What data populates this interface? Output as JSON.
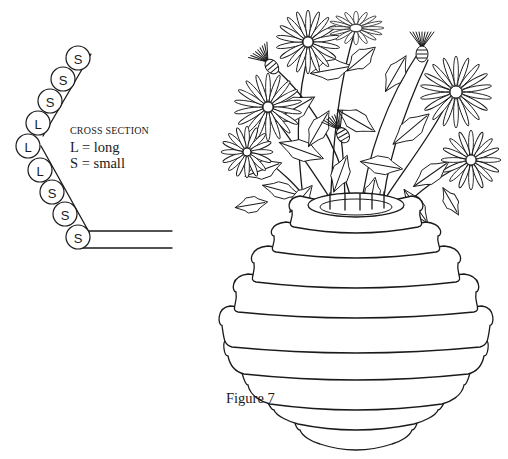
{
  "figure": {
    "caption": "Figure 7"
  },
  "cross_section": {
    "title": "CROSS SECTION",
    "legend": [
      {
        "key": "L",
        "sep": "=",
        "meaning": "long",
        "text": "L = long"
      },
      {
        "key": "S",
        "sep": "=",
        "meaning": "small",
        "text": "S = small"
      }
    ],
    "coils": [
      "S",
      "S",
      "S",
      "L",
      "L",
      "L",
      "S",
      "S",
      "S"
    ]
  },
  "vase": {
    "coil_bands": 8
  },
  "bouquet": {
    "daisies": 7,
    "thistles": 3
  }
}
